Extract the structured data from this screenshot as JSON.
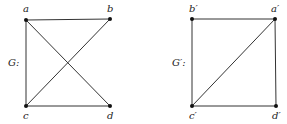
{
  "graphs": [
    {
      "name": "G",
      "label": "G:",
      "label_pos": [
        8,
        66
      ],
      "vertices": [
        {
          "id": "a",
          "label": "a",
          "x": 26,
          "y": 20,
          "lx": 23,
          "ly": 12
        },
        {
          "id": "b",
          "label": "b",
          "x": 110,
          "y": 19,
          "lx": 107,
          "ly": 12
        },
        {
          "id": "c",
          "label": "c",
          "x": 26,
          "y": 106,
          "lx": 23,
          "ly": 119
        },
        {
          "id": "d",
          "label": "d",
          "x": 110,
          "y": 106,
          "lx": 107,
          "ly": 119
        }
      ],
      "edges": [
        [
          "a",
          "b"
        ],
        [
          "a",
          "c"
        ],
        [
          "a",
          "d"
        ],
        [
          "b",
          "c"
        ],
        [
          "c",
          "d"
        ]
      ]
    },
    {
      "name": "G'",
      "label": "G′:",
      "label_pos": [
        172,
        66
      ],
      "vertices": [
        {
          "id": "b'",
          "label": "b′",
          "x": 192,
          "y": 19,
          "lx": 189,
          "ly": 12
        },
        {
          "id": "a'",
          "label": "a′",
          "x": 275,
          "y": 19,
          "lx": 271,
          "ly": 12
        },
        {
          "id": "c'",
          "label": "c′",
          "x": 192,
          "y": 106,
          "lx": 189,
          "ly": 119
        },
        {
          "id": "d'",
          "label": "d′",
          "x": 276,
          "y": 106,
          "lx": 272,
          "ly": 119
        }
      ],
      "edges": [
        [
          "b'",
          "a'"
        ],
        [
          "b'",
          "c'"
        ],
        [
          "a'",
          "c'"
        ],
        [
          "a'",
          "d'"
        ],
        [
          "c'",
          "d'"
        ]
      ]
    }
  ]
}
